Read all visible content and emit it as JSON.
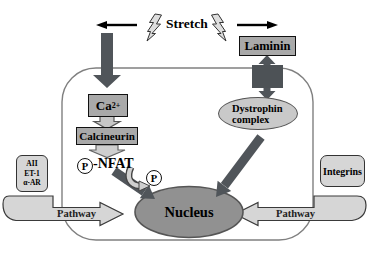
{
  "colors": {
    "box_fill": "#a9a9a9",
    "dark_arrow": "#50555a",
    "nucleus_fill": "#919191",
    "organelle_fill": "#c9c9c9",
    "ribbon_fill": "#d6d6d6",
    "membrane_stroke": "#808080"
  },
  "stimulus": {
    "label": "Stretch",
    "icons": [
      "lightning-bolt",
      "lightning-bolt"
    ]
  },
  "extracellular": {
    "laminin": "Laminin",
    "receptors": [
      "AII",
      "ET-1",
      "α-AR"
    ],
    "integrins": "Integrins"
  },
  "intracellular": {
    "calcium": {
      "base": "Ca",
      "sup": "2+"
    },
    "calcineurin": "Calcineurin",
    "nfat": {
      "phosphate": "P",
      "label": "-NFAT"
    },
    "released_phosphate": "P",
    "dystrophin_complex": {
      "line1": "Dystrophin",
      "line2": "complex"
    },
    "nucleus": "Nucleus"
  },
  "pathways": {
    "left": "Pathway",
    "right": "Pathway"
  }
}
